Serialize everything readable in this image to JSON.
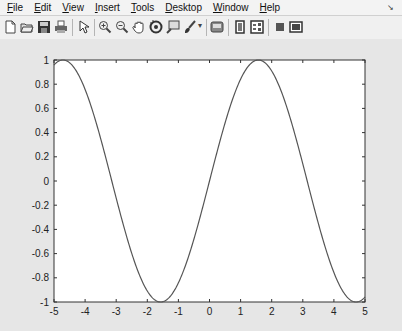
{
  "menubar": {
    "items": [
      {
        "label": "File",
        "accel": "F"
      },
      {
        "label": "Edit",
        "accel": "E"
      },
      {
        "label": "View",
        "accel": "V"
      },
      {
        "label": "Insert",
        "accel": "I"
      },
      {
        "label": "Tools",
        "accel": "T"
      },
      {
        "label": "Desktop",
        "accel": "D"
      },
      {
        "label": "Window",
        "accel": "W"
      },
      {
        "label": "Help",
        "accel": "H"
      }
    ],
    "dock_icon": "dock-arrow-icon"
  },
  "toolbar": {
    "buttons": [
      "new-figure-icon",
      "open-file-icon",
      "save-icon",
      "print-icon",
      "edit-plot-pointer-icon",
      "zoom-in-icon",
      "zoom-out-icon",
      "pan-hand-icon",
      "rotate-3d-icon",
      "data-cursor-icon",
      "brush-icon",
      "link-plot-icon",
      "insert-colorbar-icon",
      "insert-legend-icon",
      "hide-plot-tools-icon",
      "show-plot-tools-icon"
    ]
  },
  "chart_data": {
    "type": "line",
    "title": "",
    "xlabel": "",
    "ylabel": "",
    "function": "y = sin(x)",
    "xlim": [
      -5,
      5
    ],
    "ylim": [
      -1,
      1
    ],
    "xticks": [
      "-5",
      "-4",
      "-3",
      "-2",
      "-1",
      "0",
      "1",
      "2",
      "3",
      "4",
      "5"
    ],
    "yticks": [
      "-1",
      "-0.8",
      "-0.6",
      "-0.4",
      "-0.2",
      "0",
      "0.2",
      "0.4",
      "0.6",
      "0.8",
      "1"
    ],
    "grid": false,
    "legend": null,
    "series": [
      {
        "name": "sin(x)",
        "color": "#555555",
        "x": [
          -5,
          -4.5,
          -4,
          -3.5,
          -3,
          -2.5,
          -2,
          -1.5,
          -1,
          -0.5,
          0,
          0.5,
          1,
          1.5,
          2,
          2.5,
          3,
          3.5,
          4,
          4.5,
          5
        ],
        "y": [
          0.959,
          0.978,
          0.757,
          0.351,
          -0.141,
          -0.598,
          -0.909,
          -0.997,
          -0.841,
          -0.479,
          0,
          0.479,
          0.841,
          0.997,
          0.909,
          0.598,
          0.141,
          -0.351,
          -0.757,
          -0.978,
          -0.959
        ]
      }
    ]
  }
}
